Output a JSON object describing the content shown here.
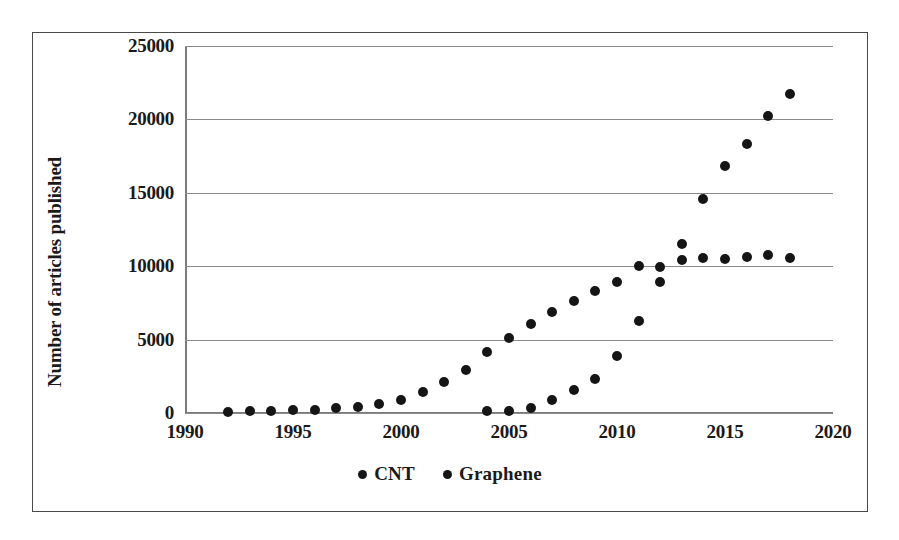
{
  "chart_data": {
    "type": "scatter",
    "title": "",
    "xlabel": "",
    "ylabel": "Number of articles published",
    "xlim": [
      1990,
      2020
    ],
    "ylim": [
      0,
      25000
    ],
    "xticks": [
      1990,
      1995,
      2000,
      2005,
      2010,
      2015,
      2020
    ],
    "yticks": [
      0,
      5000,
      10000,
      15000,
      20000,
      25000
    ],
    "grid": "horizontal",
    "legend_position": "bottom-center",
    "series": [
      {
        "name": "CNT",
        "marker": "circle",
        "color": "#151515",
        "x": [
          1992,
          1993,
          1994,
          1995,
          1996,
          1997,
          1998,
          1999,
          2000,
          2001,
          2002,
          2003,
          2004,
          2005,
          2006,
          2007,
          2008,
          2009,
          2010,
          2011,
          2012,
          2013,
          2014,
          2015,
          2016,
          2017,
          2018
        ],
        "y": [
          60,
          110,
          140,
          180,
          230,
          330,
          440,
          600,
          900,
          1400,
          2100,
          2950,
          4150,
          5100,
          6050,
          6850,
          7650,
          8300,
          8900,
          10000,
          9950,
          11500,
          10550,
          10500,
          10650,
          10750,
          10550
        ]
      },
      {
        "name": "Graphene",
        "marker": "circle",
        "color": "#151515",
        "x": [
          2004,
          2005,
          2006,
          2007,
          2008,
          2009,
          2010,
          2011,
          2012,
          2013,
          2014,
          2015,
          2016,
          2017,
          2018
        ],
        "y": [
          110,
          130,
          330,
          900,
          1550,
          2350,
          3900,
          6300,
          8900,
          10400,
          14600,
          16800,
          18300,
          20200,
          21750
        ]
      }
    ]
  },
  "legend": {
    "items": [
      {
        "label": "CNT"
      },
      {
        "label": "Graphene"
      }
    ]
  },
  "axis": {
    "y_label": "Number of articles published",
    "y_tick_labels": [
      "0",
      "5000",
      "10000",
      "15000",
      "20000",
      "25000"
    ],
    "x_tick_labels": [
      "1990",
      "1995",
      "2000",
      "2005",
      "2010",
      "2015",
      "2020"
    ]
  },
  "colors": {
    "marker": "#151515",
    "gridline": "#8a8a8a",
    "frame": "#4a4a4a",
    "text": "#1a1a1a"
  }
}
